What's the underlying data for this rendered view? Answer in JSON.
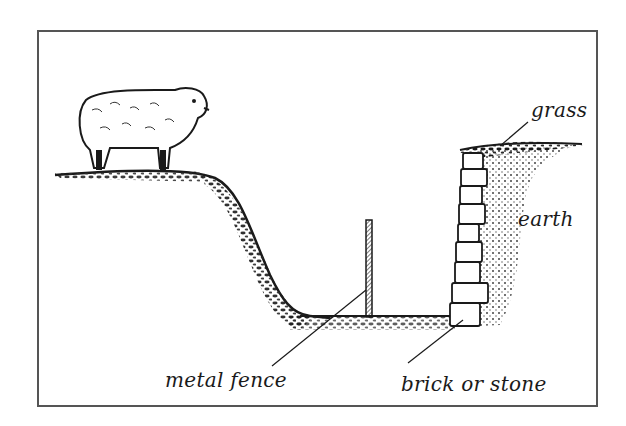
{
  "diagram": {
    "labels": {
      "grass": "grass",
      "earth": "earth",
      "metal_fence": "metal fence",
      "brick_or_stone": "brick or stone"
    },
    "icons": [
      "sheep-icon"
    ],
    "colors": {
      "ink": "#1a1a1a",
      "frame": "#555555",
      "background": "#ffffff"
    }
  }
}
